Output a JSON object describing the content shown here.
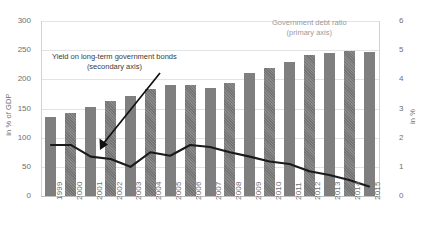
{
  "chart_data": {
    "type": "bar",
    "title": "",
    "subtitle": "",
    "xlabel": "",
    "ylabel": "in % of GDP",
    "ylabel_secondary": "in %",
    "grid": true,
    "legend_position": "annotations",
    "categories": [
      "1999",
      "2000",
      "2001",
      "2002",
      "2003",
      "2004",
      "2005",
      "2006",
      "2007",
      "2008",
      "2009",
      "2010",
      "2011",
      "2012",
      "2013",
      "2014",
      "2015"
    ],
    "ylim": [
      0,
      300
    ],
    "yticks": [
      0,
      50,
      100,
      150,
      200,
      250,
      300
    ],
    "ylim_secondary": [
      0,
      6
    ],
    "yticks_secondary": [
      0,
      1,
      2,
      3,
      4,
      5,
      6
    ],
    "series": [
      {
        "name": "Government debt ratio",
        "type": "bar",
        "axis": "primary",
        "unit": "% of GDP",
        "color": "#7f7f7f",
        "values": [
          135,
          143,
          153,
          163,
          172,
          183,
          190,
          190,
          186,
          193,
          211,
          219,
          230,
          242,
          246,
          248,
          247
        ]
      },
      {
        "name": "Yield on long-term government bonds",
        "type": "line",
        "axis": "secondary",
        "unit": "%",
        "color": "#1a1a1a",
        "values": [
          1.75,
          1.75,
          1.35,
          1.27,
          1.0,
          1.5,
          1.38,
          1.75,
          1.68,
          1.5,
          1.35,
          1.18,
          1.1,
          0.85,
          0.72,
          0.55,
          0.33
        ]
      }
    ],
    "annotations": [
      {
        "id": "yield",
        "line1": "Yield on long-term government bonds",
        "line2": "(secondary axis)",
        "color": "#3a3a3a"
      },
      {
        "id": "debt",
        "line1": "Government debt ratio",
        "line2": "(primary axis)",
        "color": "#9a9a9a"
      }
    ]
  },
  "axes": {
    "left_ticks": [
      "300",
      "250",
      "200",
      "150",
      "100",
      "50",
      "0"
    ],
    "right_ticks": [
      "6",
      "5",
      "4",
      "3",
      "2",
      "1",
      "0"
    ],
    "left_title": "in % of GDP",
    "right_title": "in %"
  }
}
